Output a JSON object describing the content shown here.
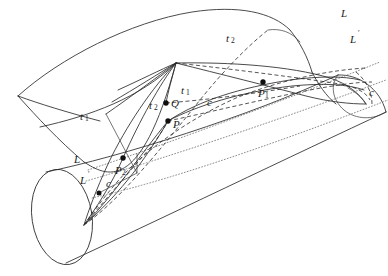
{
  "figure": {
    "title": "",
    "kind": "geometric-diagram",
    "width": 388,
    "height": 276,
    "background_color": "#ffffff",
    "ink_color": "#2b2b2b",
    "dotted_color": "#777777"
  },
  "labels": [
    {
      "id": "L-top-right",
      "text": "L",
      "sub": "",
      "x": 341,
      "y": 14,
      "italic": true
    },
    {
      "id": "L-prime-top-right",
      "text": "L",
      "sub": "",
      "prime": true,
      "x": 352,
      "y": 40,
      "italic": true
    },
    {
      "id": "t2-upper",
      "text": "t",
      "sub": "2",
      "x": 229,
      "y": 39,
      "italic": true
    },
    {
      "id": "t1-left",
      "text": "t",
      "sub": "1",
      "x": 83,
      "y": 117,
      "italic": true
    },
    {
      "id": "t1-center",
      "text": "t",
      "sub": "1",
      "x": 184,
      "y": 91,
      "italic": true
    },
    {
      "id": "t2-center",
      "text": "t",
      "sub": "2",
      "x": 152,
      "y": 107,
      "italic": true
    },
    {
      "id": "Q-point",
      "text": "Q",
      "sub": "",
      "x": 172,
      "y": 104,
      "italic": true
    },
    {
      "id": "P-point",
      "text": "P",
      "sub": "",
      "x": 174,
      "y": 124,
      "italic": true
    },
    {
      "id": "c-center",
      "text": "c",
      "sub": "",
      "x": 209,
      "y": 103,
      "italic": true
    },
    {
      "id": "P1-point",
      "text": "P",
      "sub": "1",
      "x": 262,
      "y": 94,
      "italic": true
    },
    {
      "id": "c-right",
      "text": "c",
      "sub": "",
      "x": 371,
      "y": 93,
      "italic": true
    },
    {
      "id": "L-lower-left",
      "text": "L",
      "sub": "",
      "x": 76,
      "y": 160,
      "italic": true
    },
    {
      "id": "L-prime-lower",
      "text": "L",
      "sub": "",
      "prime": true,
      "x": 82,
      "y": 181,
      "italic": true
    },
    {
      "id": "c-lower-left",
      "text": "c",
      "sub": "",
      "x": 108,
      "y": 184,
      "italic": true
    },
    {
      "id": "P2-point",
      "text": "P",
      "sub": "2",
      "x": 119,
      "y": 170,
      "italic": true
    }
  ],
  "points": [
    {
      "id": "dot-Q",
      "x": 166,
      "y": 103,
      "r": 2.6
    },
    {
      "id": "dot-P",
      "x": 168,
      "y": 121,
      "r": 2.6
    },
    {
      "id": "dot-P1",
      "x": 263,
      "y": 82,
      "r": 2.6
    },
    {
      "id": "dot-P2",
      "x": 123,
      "y": 158,
      "r": 2.6
    },
    {
      "id": "dot-lower",
      "x": 99,
      "y": 193,
      "r": 2.4
    }
  ]
}
